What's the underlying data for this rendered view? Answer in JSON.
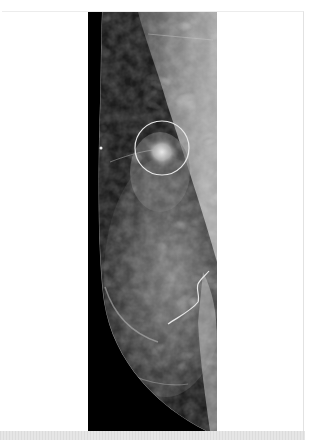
{
  "figure": {
    "type": "mammogram",
    "view": "mediolateral oblique",
    "annotations": [
      {
        "kind": "circle",
        "label": "circled-lesion",
        "cx": 74,
        "cy": 136,
        "r": 27,
        "color": "#e8e8e8"
      },
      {
        "kind": "freehand-line",
        "label": "traced-margin",
        "color": "#e8e8e8"
      }
    ],
    "colors": {
      "background": "#ffffff",
      "image_background": "#000000",
      "annotation": "#e8e8e8",
      "bottom_band": "#e0e0e0"
    }
  }
}
